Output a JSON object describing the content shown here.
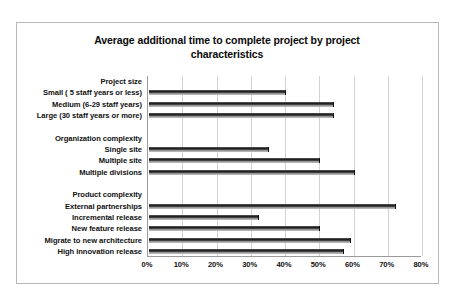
{
  "chart_data": {
    "type": "bar",
    "orientation": "horizontal",
    "title": "Average additional time to complete project by project characteristics",
    "xlabel": "",
    "ylabel": "",
    "xlim": [
      0,
      80
    ],
    "xtick_labels": [
      "0%",
      "10%",
      "20%",
      "30%",
      "40%",
      "50%",
      "60%",
      "70%",
      "80%"
    ],
    "xtick_values": [
      0,
      10,
      20,
      30,
      40,
      50,
      60,
      70,
      80
    ],
    "grid": true,
    "legend": "none",
    "rows": [
      {
        "label": "Project size",
        "value": null,
        "is_group_header": true
      },
      {
        "label": "Small ( 5 staff years or less)",
        "value": 40,
        "is_group_header": false
      },
      {
        "label": "Medium (6-29 staff years)",
        "value": 54,
        "is_group_header": false
      },
      {
        "label": "Large (30 staff years or more)",
        "value": 54,
        "is_group_header": false
      },
      {
        "label": "",
        "value": null,
        "is_group_header": false
      },
      {
        "label": "Organization complexity",
        "value": null,
        "is_group_header": true
      },
      {
        "label": "Single site",
        "value": 35,
        "is_group_header": false
      },
      {
        "label": "Multiple site",
        "value": 50,
        "is_group_header": false
      },
      {
        "label": "Multiple divisions",
        "value": 60,
        "is_group_header": false
      },
      {
        "label": "",
        "value": null,
        "is_group_header": false
      },
      {
        "label": "Product complexity",
        "value": null,
        "is_group_header": true
      },
      {
        "label": "External partnerships",
        "value": 72,
        "is_group_header": false
      },
      {
        "label": "Incremental release",
        "value": 32,
        "is_group_header": false
      },
      {
        "label": "New feature release",
        "value": 50,
        "is_group_header": false
      },
      {
        "label": "Migrate to new architecture",
        "value": 59,
        "is_group_header": false
      },
      {
        "label": "High innovation release",
        "value": 57,
        "is_group_header": false
      }
    ],
    "colors": {
      "bar": "#1a1a1a",
      "gridline": "#d2d2d2",
      "axis": "#9a9a9a",
      "frame": "#b9b9b9",
      "text": "#111111",
      "background": "#ffffff"
    }
  }
}
